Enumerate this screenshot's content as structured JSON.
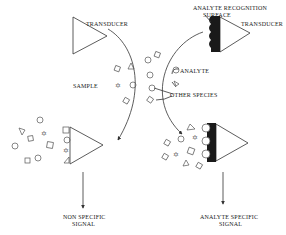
{
  "diagram": {
    "type": "biosensor-schematic",
    "labels": {
      "transducer_left": "TRANSDUCER",
      "analyte_recognition": "ANALYTE RECOGNITION",
      "surface": "SURFACE",
      "transducer_right": "TRANSDUCER",
      "sample": "SAMPLE",
      "analyte": "ANALYTE",
      "other_species": "OTHER SPECIES",
      "non_specific_line1": "NON SPECIFIC",
      "non_specific_line2": "SIGNAL",
      "analyte_specific_line1": "ANALYTE SPECIFIC",
      "analyte_specific_line2": "SIGNAL"
    },
    "nodes": [
      {
        "id": "transducer-left-top",
        "shape": "triangle",
        "label": "TRANSDUCER"
      },
      {
        "id": "transducer-right-top",
        "shape": "triangle-with-recognition-surface",
        "label": "TRANSDUCER"
      },
      {
        "id": "transducer-left-bottom",
        "shape": "triangle-with-nonspecific-binding"
      },
      {
        "id": "transducer-right-bottom",
        "shape": "triangle-with-bound-analyte"
      }
    ],
    "edges": [
      {
        "from": "transducer-left-top",
        "to": "transducer-left-bottom",
        "style": "curved-arrow"
      },
      {
        "from": "transducer-right-top",
        "to": "transducer-right-bottom",
        "style": "curved-arrow"
      },
      {
        "from": "transducer-left-bottom",
        "to": "non-specific-signal",
        "style": "arrow"
      },
      {
        "from": "transducer-right-bottom",
        "to": "analyte-specific-signal",
        "style": "arrow"
      }
    ],
    "colors": {
      "line": "#333333",
      "fill_dark": "#1a1a1a",
      "background": "#ffffff"
    }
  }
}
